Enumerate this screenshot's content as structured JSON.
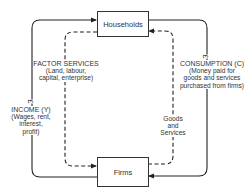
{
  "diagram": {
    "type": "circular-flow-of-income",
    "nodes": {
      "households": {
        "label": "Households"
      },
      "firms": {
        "label": "Firms"
      }
    },
    "flows": {
      "factor_services": {
        "title": "FACTOR SERVICES",
        "detail_lines": [
          "(Land, labour,",
          "capital, enterprise)"
        ],
        "style": "dashed",
        "direction": "households-to-firms"
      },
      "income": {
        "title": "INCOME (Y)",
        "detail_lines": [
          "(Wages, rent,",
          "interest,",
          "profit)"
        ],
        "currency_symbol": "£",
        "style": "solid",
        "direction": "firms-to-households"
      },
      "consumption": {
        "title": "CONSUMPTION (C)",
        "detail_lines": [
          "(Money paid for",
          "goods and services",
          "purchased from firms)"
        ],
        "currency_symbol": "£",
        "style": "solid",
        "direction": "households-to-firms"
      },
      "goods_services": {
        "title_lines": [
          "Goods",
          "and",
          "Services"
        ],
        "style": "dashed",
        "direction": "firms-to-households"
      }
    },
    "colors": {
      "line": "#222222",
      "box_border": "#333333",
      "background": "#ffffff"
    }
  }
}
